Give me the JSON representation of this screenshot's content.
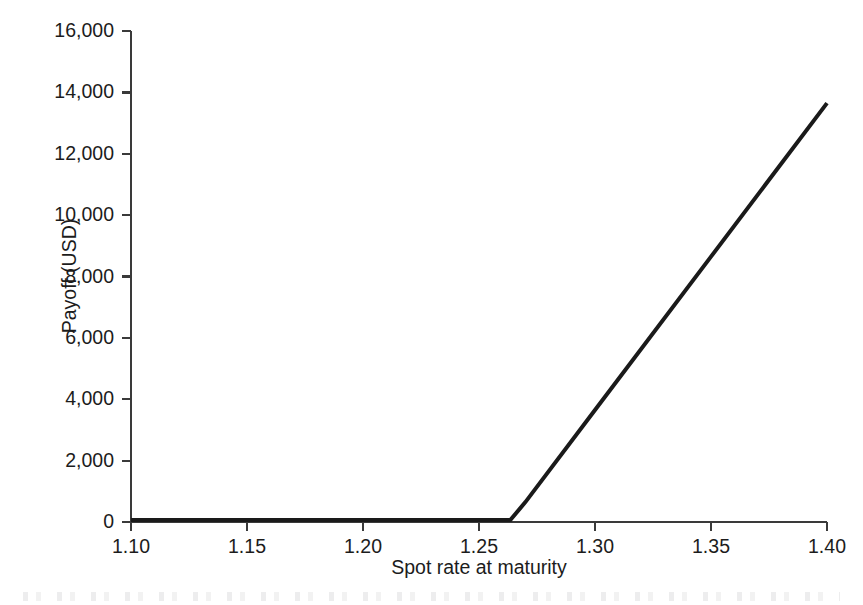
{
  "chart_data": {
    "type": "line",
    "title": "",
    "subtitle": "",
    "xlabel": "Spot rate at maturity",
    "ylabel": "Payoff (USD)",
    "xlim": [
      1.1,
      1.4
    ],
    "ylim": [
      0,
      16000
    ],
    "grid": false,
    "legend": null,
    "legend_position": "none",
    "xticks": [
      1.1,
      1.15,
      1.2,
      1.25,
      1.3,
      1.35,
      1.4
    ],
    "xtick_labels": [
      "1.10",
      "1.15",
      "1.20",
      "1.25",
      "1.30",
      "1.35",
      "1.40"
    ],
    "yticks": [
      0,
      2000,
      4000,
      6000,
      8000,
      10000,
      12000,
      14000,
      16000
    ],
    "ytick_labels": [
      "0",
      "2,000",
      "4,000",
      "6,000",
      "8,000",
      "10,000",
      "12,000",
      "14,000",
      "16,000"
    ],
    "series": [
      {
        "name": "Payoff",
        "color": "#1a1a1a",
        "line_width": 4,
        "x": [
          1.1,
          1.15,
          1.2,
          1.25,
          1.2635,
          1.27,
          1.3,
          1.35,
          1.4
        ],
        "values": [
          0,
          0,
          0,
          0,
          0,
          650,
          3650,
          8650,
          13650
        ]
      }
    ],
    "annotations": [
      {
        "text": "kink at strike",
        "x": 1.2635,
        "y": 0
      }
    ]
  },
  "axes": {
    "x_axis_name": "Spot rate at maturity",
    "y_axis_name": "Payoff (USD)"
  }
}
